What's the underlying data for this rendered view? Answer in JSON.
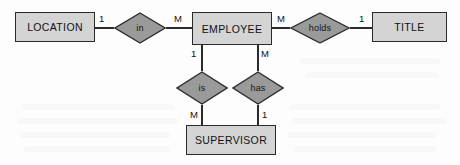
{
  "diagram": {
    "type": "entity-relationship-diagram",
    "notation": "Chen",
    "width": 460,
    "height": 165,
    "colors": {
      "entity_fill": "#d4d4d4",
      "relationship_fill": "#9a9a9a",
      "stroke": "#2b2b2b",
      "text": "#111111",
      "background": "#fdfdfd"
    },
    "entities": [
      {
        "id": "location",
        "label": "LOCATION",
        "x": 15,
        "y": 12,
        "w": 80,
        "h": 30
      },
      {
        "id": "employee",
        "label": "EMPLOYEE",
        "x": 192,
        "y": 12,
        "w": 80,
        "h": 33
      },
      {
        "id": "title",
        "label": "TITLE",
        "x": 372,
        "y": 12,
        "w": 75,
        "h": 30
      },
      {
        "id": "supervisor",
        "label": "SUPERVISOR",
        "x": 186,
        "y": 125,
        "w": 90,
        "h": 30
      }
    ],
    "relationships": [
      {
        "id": "in",
        "label": "in",
        "cx": 140,
        "cy": 28,
        "rx": 26,
        "ry": 16
      },
      {
        "id": "holds",
        "label": "holds",
        "cx": 320,
        "cy": 28,
        "rx": 30,
        "ry": 16
      },
      {
        "id": "is",
        "label": "is",
        "cx": 202,
        "cy": 88,
        "rx": 26,
        "ry": 17
      },
      {
        "id": "has",
        "label": "has",
        "cx": 258,
        "cy": 88,
        "rx": 26,
        "ry": 17
      }
    ],
    "cardinalities": [
      {
        "id": "location-in",
        "label": "1",
        "x": 99,
        "y": 14,
        "from": "location",
        "to": "in"
      },
      {
        "id": "in-employee",
        "label": "M",
        "x": 174,
        "y": 14,
        "from": "in",
        "to": "employee"
      },
      {
        "id": "employee-holds",
        "label": "M",
        "x": 277,
        "y": 14,
        "from": "employee",
        "to": "holds"
      },
      {
        "id": "holds-title",
        "label": "1",
        "x": 359,
        "y": 14,
        "from": "holds",
        "to": "title"
      },
      {
        "id": "employee-is",
        "label": "1",
        "x": 191,
        "y": 49,
        "from": "employee",
        "to": "is"
      },
      {
        "id": "employee-has",
        "label": "M",
        "x": 261,
        "y": 49,
        "from": "employee",
        "to": "has"
      },
      {
        "id": "is-supervisor",
        "label": "M",
        "x": 190,
        "y": 110,
        "from": "is",
        "to": "supervisor"
      },
      {
        "id": "has-supervisor",
        "label": "1",
        "x": 262,
        "y": 110,
        "from": "has",
        "to": "supervisor"
      }
    ]
  }
}
